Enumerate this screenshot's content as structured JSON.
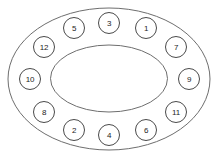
{
  "diagram": {
    "background_color": "#ffffff",
    "stroke_color": "#6e6e6e",
    "node_stroke_color": "#4a4a4a",
    "node_fill_color": "#ffffff",
    "label_color": "#1d1d1d",
    "outer_ellipse": {
      "cx": 109,
      "cy": 79,
      "rx": 101,
      "ry": 71
    },
    "inner_ellipse": {
      "cx": 109,
      "cy": 78.5,
      "rx": 58.5,
      "ry": 33.5
    },
    "node_radius": 10.5,
    "nodes": [
      {
        "id": "node-3",
        "label": "3",
        "cx": 109,
        "cy": 23
      },
      {
        "id": "node-1",
        "label": "1",
        "cx": 146,
        "cy": 28
      },
      {
        "id": "node-7",
        "label": "7",
        "cx": 176,
        "cy": 47
      },
      {
        "id": "node-9",
        "label": "9",
        "cx": 189,
        "cy": 79
      },
      {
        "id": "node-11",
        "label": "11",
        "cx": 176,
        "cy": 112
      },
      {
        "id": "node-6",
        "label": "6",
        "cx": 146,
        "cy": 130
      },
      {
        "id": "node-4",
        "label": "4",
        "cx": 109,
        "cy": 135
      },
      {
        "id": "node-2",
        "label": "2",
        "cx": 74,
        "cy": 130
      },
      {
        "id": "node-8",
        "label": "8",
        "cx": 44,
        "cy": 112
      },
      {
        "id": "node-10",
        "label": "10",
        "cx": 30,
        "cy": 79
      },
      {
        "id": "node-12",
        "label": "12",
        "cx": 44,
        "cy": 47
      },
      {
        "id": "node-5",
        "label": "5",
        "cx": 74,
        "cy": 28
      }
    ]
  }
}
